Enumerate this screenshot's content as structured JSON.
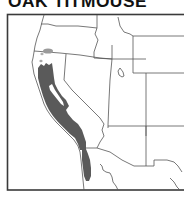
{
  "title": "OAK TITMOUSE",
  "map": {
    "region": "Western United States",
    "frame": {
      "x": 7,
      "y": 14,
      "width": 190,
      "height": 176
    },
    "colors": {
      "background": "#ffffff",
      "border": "#3a3a3a",
      "state_lines": "#555555",
      "range_year_round": "#5a5a5a",
      "range_light": "#9a9a9a"
    },
    "legend": []
  }
}
